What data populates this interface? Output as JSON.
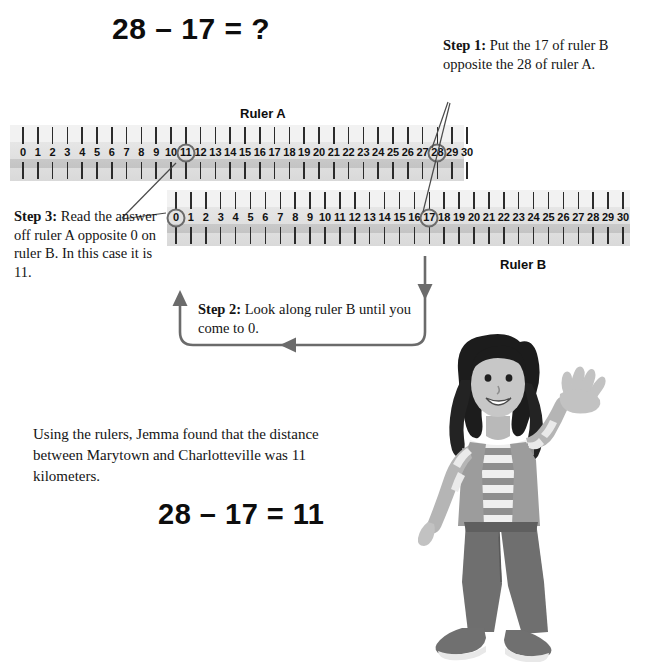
{
  "equations": {
    "top": "28 – 17 = ?",
    "bottom": "28 – 17 = 11"
  },
  "rulers": {
    "a": {
      "label": "Ruler A",
      "min": 0,
      "max": 30,
      "highlighted": [
        11,
        28
      ],
      "ticks": [
        "0",
        "1",
        "2",
        "3",
        "4",
        "5",
        "6",
        "7",
        "8",
        "9",
        "10",
        "11",
        "12",
        "13",
        "14",
        "15",
        "16",
        "17",
        "18",
        "19",
        "20",
        "21",
        "22",
        "23",
        "24",
        "25",
        "26",
        "27",
        "28",
        "29",
        "30"
      ]
    },
    "b": {
      "label": "Ruler B",
      "min": 0,
      "max": 30,
      "highlighted": [
        0,
        17
      ],
      "ticks": [
        "0",
        "1",
        "2",
        "3",
        "4",
        "5",
        "6",
        "7",
        "8",
        "9",
        "10",
        "11",
        "12",
        "13",
        "14",
        "15",
        "16",
        "17",
        "18",
        "19",
        "20",
        "21",
        "22",
        "23",
        "24",
        "25",
        "26",
        "27",
        "28",
        "29",
        "30"
      ]
    }
  },
  "steps": {
    "step1": {
      "label": "Step 1:",
      "body": " Put the 17 of ruler B opposite the 28 of ruler A."
    },
    "step2": {
      "label": "Step 2:",
      "body": " Look along ruler B until you come to 0."
    },
    "step3": {
      "label": "Step 3:",
      "body": " Read the answer off ruler A opposite 0 on ruler B. In this case it is 11."
    }
  },
  "story": "Using the rulers, Jemma found that the distance between Marytown and Charlotteville was 11 kilometers.",
  "illustration": {
    "alt": "Girl with braided pigtails waving, wearing a striped shirt and vest"
  },
  "colors": {
    "ink": "#141414",
    "ruler_light": "#f2f2f2",
    "ruler_band": "#c4c4c4",
    "arrow": "#6b6b6b",
    "ring": "#6b6b6b"
  }
}
